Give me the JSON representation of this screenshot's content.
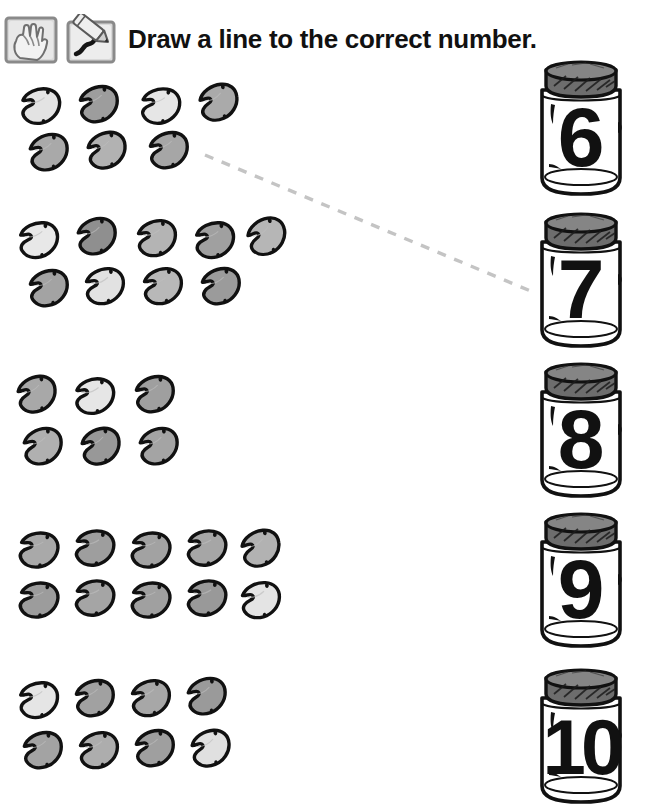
{
  "worksheet": {
    "title": "Draw a line to the correct number.",
    "background_color": "#ffffff",
    "ink_color": "#111111",
    "connector_color": "#c4c4c4"
  },
  "header": {
    "icons": [
      {
        "name": "hand-counting-icon",
        "label": "hand counting fingers"
      },
      {
        "name": "pencil-drawing-icon",
        "label": "pencil drawing a squiggle"
      }
    ]
  },
  "bean_groups": [
    {
      "id": "group-1",
      "count": 7,
      "rows": [
        4,
        3
      ],
      "x": 18,
      "y": 86,
      "beans": [
        {
          "fill": "#e3e3e3",
          "rot": -18,
          "x": 0,
          "y": 0
        },
        {
          "fill": "#9d9d9d",
          "rot": -24,
          "x": 58,
          "y": -2
        },
        {
          "fill": "#e6e6e6",
          "rot": -16,
          "x": 120,
          "y": 0
        },
        {
          "fill": "#aaaaaa",
          "rot": -30,
          "x": 178,
          "y": -4
        },
        {
          "fill": "#a9a9a9",
          "rot": -26,
          "x": 8,
          "y": 46
        },
        {
          "fill": "#b2b2b2",
          "rot": -28,
          "x": 66,
          "y": 44
        },
        {
          "fill": "#a6a6a6",
          "rot": -24,
          "x": 128,
          "y": 44
        }
      ]
    },
    {
      "id": "group-2",
      "count": 9,
      "rows": [
        5,
        4
      ],
      "x": 16,
      "y": 218,
      "beans": [
        {
          "fill": "#e8e8e8",
          "rot": -20,
          "x": 0,
          "y": 2
        },
        {
          "fill": "#8f8f8f",
          "rot": -26,
          "x": 58,
          "y": -2
        },
        {
          "fill": "#b4b4b4",
          "rot": -22,
          "x": 118,
          "y": 0
        },
        {
          "fill": "#a0a0a0",
          "rot": -20,
          "x": 176,
          "y": 2
        },
        {
          "fill": "#b6b6b6",
          "rot": -34,
          "x": 228,
          "y": -2
        },
        {
          "fill": "#a3a3a3",
          "rot": -24,
          "x": 10,
          "y": 50
        },
        {
          "fill": "#e2e2e2",
          "rot": -22,
          "x": 66,
          "y": 48
        },
        {
          "fill": "#b8b8b8",
          "rot": -22,
          "x": 124,
          "y": 48
        },
        {
          "fill": "#9b9b9b",
          "rot": -24,
          "x": 182,
          "y": 48
        }
      ]
    },
    {
      "id": "group-3",
      "count": 6,
      "rows": [
        3,
        3
      ],
      "x": 14,
      "y": 374,
      "beans": [
        {
          "fill": "#a8a8a8",
          "rot": -28,
          "x": 0,
          "y": 0
        },
        {
          "fill": "#e6e6e6",
          "rot": -18,
          "x": 58,
          "y": 2
        },
        {
          "fill": "#9f9f9f",
          "rot": -24,
          "x": 118,
          "y": 0
        },
        {
          "fill": "#b0b0b0",
          "rot": -26,
          "x": 6,
          "y": 52
        },
        {
          "fill": "#989898",
          "rot": -28,
          "x": 64,
          "y": 52
        },
        {
          "fill": "#a4a4a4",
          "rot": -26,
          "x": 122,
          "y": 52
        }
      ]
    },
    {
      "id": "group-4",
      "count": 10,
      "rows": [
        5,
        5
      ],
      "x": 16,
      "y": 528,
      "beans": [
        {
          "fill": "#a9a9a9",
          "rot": -12,
          "x": 0,
          "y": 2
        },
        {
          "fill": "#9e9e9e",
          "rot": -14,
          "x": 56,
          "y": 0
        },
        {
          "fill": "#a2a2a2",
          "rot": -12,
          "x": 112,
          "y": 2
        },
        {
          "fill": "#a6a6a6",
          "rot": -14,
          "x": 168,
          "y": 0
        },
        {
          "fill": "#b2b2b2",
          "rot": -30,
          "x": 222,
          "y": 0
        },
        {
          "fill": "#9c9c9c",
          "rot": -12,
          "x": 0,
          "y": 52
        },
        {
          "fill": "#a5a5a5",
          "rot": -14,
          "x": 56,
          "y": 50
        },
        {
          "fill": "#a0a0a0",
          "rot": -12,
          "x": 112,
          "y": 52
        },
        {
          "fill": "#999999",
          "rot": -14,
          "x": 168,
          "y": 50
        },
        {
          "fill": "#e4e4e4",
          "rot": -22,
          "x": 222,
          "y": 52
        }
      ]
    },
    {
      "id": "group-5",
      "count": 8,
      "rows": [
        4,
        4
      ],
      "x": 16,
      "y": 678,
      "beans": [
        {
          "fill": "#e5e5e5",
          "rot": -20,
          "x": 0,
          "y": 2
        },
        {
          "fill": "#a1a1a1",
          "rot": -24,
          "x": 56,
          "y": 0
        },
        {
          "fill": "#a7a7a7",
          "rot": -22,
          "x": 112,
          "y": 0
        },
        {
          "fill": "#9a9a9a",
          "rot": -26,
          "x": 168,
          "y": -2
        },
        {
          "fill": "#a3a3a3",
          "rot": -24,
          "x": 4,
          "y": 52
        },
        {
          "fill": "#adadad",
          "rot": -22,
          "x": 60,
          "y": 52
        },
        {
          "fill": "#9f9f9f",
          "rot": -24,
          "x": 116,
          "y": 50
        },
        {
          "fill": "#e0e0e0",
          "rot": -28,
          "x": 172,
          "y": 50
        }
      ]
    }
  ],
  "jars": [
    {
      "id": "jar-6",
      "number": "6",
      "x": 528,
      "y": 60
    },
    {
      "id": "jar-7",
      "number": "7",
      "x": 528,
      "y": 212
    },
    {
      "id": "jar-8",
      "number": "8",
      "x": 528,
      "y": 362
    },
    {
      "id": "jar-9",
      "number": "9",
      "x": 528,
      "y": 512
    },
    {
      "id": "jar-10",
      "number": "10",
      "x": 528,
      "y": 668
    }
  ],
  "connections": [
    {
      "id": "line-group1-to-jar7",
      "from": "group-1",
      "to": "jar-7",
      "x1": 205,
      "y1": 155,
      "x2": 533,
      "y2": 292,
      "style": "dashed",
      "color": "#c4c4c4"
    }
  ]
}
